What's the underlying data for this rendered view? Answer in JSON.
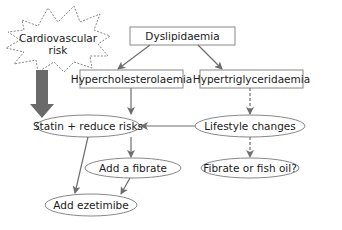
{
  "diagram": {
    "nodes": {
      "cv_risk_line1": "Cardiovascular",
      "cv_risk_line2": "risk",
      "dyslipidaemia": "Dyslipidaemia",
      "hypercholesterolaemia": "Hypercholesterolaemia",
      "hypertriglyceridaemia": "Hypertriglyceridaemia",
      "statin": "Statin + reduce risks",
      "lifestyle": "Lifestyle changes",
      "add_fibrate": "Add a fibrate",
      "fibrate_fish_oil": "Fibrate or fish oil?",
      "add_ezetimibe": "Add ezetimibe"
    },
    "edges": [
      {
        "from": "dyslipidaemia",
        "to": "hypercholesterolaemia",
        "style": "solid"
      },
      {
        "from": "dyslipidaemia",
        "to": "hypertriglyceridaemia",
        "style": "solid"
      },
      {
        "from": "cardiovascular-risk",
        "to": "statin",
        "style": "thick"
      },
      {
        "from": "hypercholesterolaemia",
        "to": "statin",
        "style": "solid"
      },
      {
        "from": "hypertriglyceridaemia",
        "to": "lifestyle",
        "style": "dashed"
      },
      {
        "from": "lifestyle",
        "to": "statin",
        "style": "solid"
      },
      {
        "from": "lifestyle",
        "to": "fibrate_fish_oil",
        "style": "dashed"
      },
      {
        "from": "statin",
        "to": "add_fibrate",
        "style": "solid"
      },
      {
        "from": "statin",
        "to": "add_ezetimibe",
        "style": "solid"
      },
      {
        "from": "add_fibrate",
        "to": "add_ezetimibe",
        "style": "solid"
      }
    ],
    "colors": {
      "stroke": "#777777",
      "arrow": "#6e6e6e",
      "thick_arrow": "#6a6a6a",
      "text": "#1a1a1a",
      "background": "#ffffff"
    }
  }
}
